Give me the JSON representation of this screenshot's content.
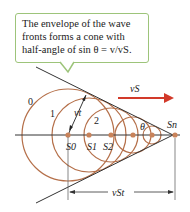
{
  "callout": {
    "line1": "The envelope of the wave",
    "line2": "fronts forms a cone with",
    "line3": "half-angle of sin θ = v/vS."
  },
  "labels": {
    "velocity": "vS",
    "radius": "vt",
    "angle": "θ",
    "distance": "vSt",
    "source_current": "Sn",
    "sources": [
      "S0",
      "S1",
      "S2"
    ],
    "wavefronts": [
      "0",
      "1",
      "2"
    ]
  },
  "colors": {
    "wavefront": "#b5704a",
    "source_dot": "#c9835a",
    "arrow": "#d23a2a",
    "line": "#333333",
    "callout_border": "#9dc47a"
  }
}
